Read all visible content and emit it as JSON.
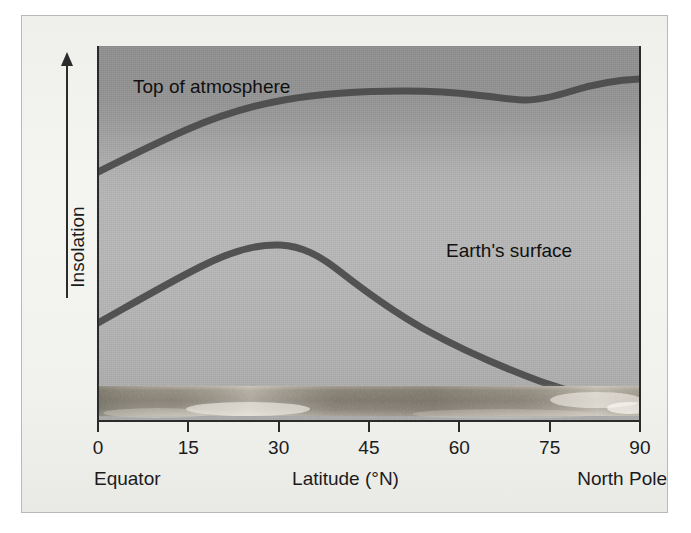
{
  "figure": {
    "y_axis": {
      "label": "Insolation",
      "arrow_icon": "up-arrow-icon",
      "direction": "increasing"
    },
    "x_axis": {
      "label": "Latitude (°N)",
      "left_caption": "Equator",
      "right_caption": "North Pole",
      "ticks": [
        "0",
        "15",
        "30",
        "45",
        "60",
        "75",
        "90"
      ]
    },
    "curve_labels": {
      "top_of_atmosphere": "Top of atmosphere",
      "earth_surface": "Earth's surface"
    },
    "colors": {
      "curve": "#4a4a4a",
      "axis": "#2b2b2b",
      "text": "#1b1b1b",
      "plot_top": "#8d8d8d",
      "plot_mid": "#b5b5b5",
      "plot_bottom": "#a8a8a8",
      "panel": "#f2f2ef",
      "panel_border": "#b9b9b5",
      "ground": "#8a8375"
    }
  },
  "chart_data": {
    "type": "line",
    "title": "",
    "xlabel": "Latitude (°N)",
    "ylabel": "Insolation",
    "xlim": [
      0,
      90
    ],
    "ylim": [
      0,
      100
    ],
    "grid": false,
    "legend": "inline-annotations",
    "xticks": [
      0,
      15,
      30,
      45,
      60,
      75,
      90
    ],
    "xticklabels": [
      "0",
      "15",
      "30",
      "45",
      "60",
      "75",
      "90"
    ],
    "yticks": [],
    "yticklabels": [],
    "x": [
      0,
      5,
      10,
      15,
      20,
      25,
      30,
      35,
      40,
      45,
      50,
      55,
      60,
      65,
      70,
      75,
      80,
      85,
      90
    ],
    "series": [
      {
        "name": "Top of atmosphere",
        "label_text": "Top of atmosphere",
        "values": [
          67,
          71,
          75,
          78,
          81,
          83,
          85,
          86,
          87,
          87,
          87,
          87,
          87,
          86,
          86,
          86,
          87,
          88,
          88
        ],
        "color": "#4a4a4a"
      },
      {
        "name": "Earth's surface",
        "label_text": "Earth's surface",
        "values": [
          38,
          43,
          48,
          52,
          55,
          57,
          58,
          58,
          57,
          55,
          53,
          51,
          49,
          47,
          45,
          43,
          42,
          40,
          39
        ],
        "color": "#4a4a4a"
      }
    ],
    "annotations": [
      {
        "text": "Top of atmosphere",
        "x": 6,
        "y": 95
      },
      {
        "text": "Earth's surface",
        "x": 58,
        "y": 62
      },
      {
        "text": "Equator",
        "x": 0,
        "y": -18
      },
      {
        "text": "North Pole",
        "x": 90,
        "y": -18
      }
    ]
  }
}
